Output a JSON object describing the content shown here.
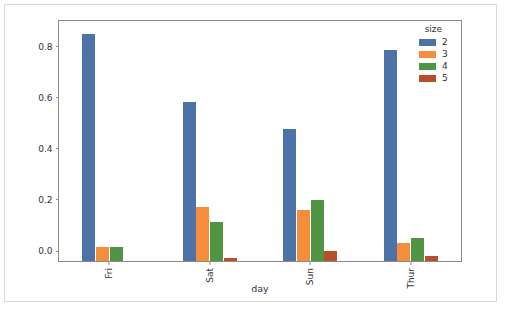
{
  "chart_data": {
    "type": "bar",
    "title": "",
    "xlabel": "day",
    "ylabel": "",
    "categories": [
      "Fri",
      "Sat",
      "Sun",
      "Thur"
    ],
    "series": [
      {
        "name": "2",
        "color": "#4c72a8",
        "values": [
          0.888,
          0.622,
          0.519,
          0.827
        ]
      },
      {
        "name": "3",
        "color": "#f58d3d",
        "values": [
          0.056,
          0.212,
          0.199,
          0.07
        ]
      },
      {
        "name": "4",
        "color": "#4f9m",
        "values": [
          0.056,
          0.152,
          0.24,
          0.09
        ]
      },
      {
        "name": "5",
        "color": "#b5502a",
        "values": [
          0.0,
          0.012,
          0.04,
          0.018
        ]
      }
    ],
    "ylim": [
      0.0,
      0.94
    ],
    "yticks": [
      0.0,
      0.2,
      0.4,
      0.6,
      0.8
    ],
    "ytick_labels": [
      "0.0",
      "0.2",
      "0.4",
      "0.6",
      "0.8"
    ],
    "grid": false,
    "legend": {
      "title": "size",
      "position": "upper right",
      "entries": [
        {
          "label": "2",
          "color": "#4c72a8"
        },
        {
          "label": "3",
          "color": "#f58d3d"
        },
        {
          "label": "4",
          "color": "#4f9544"
        },
        {
          "label": "5",
          "color": "#b5502a"
        }
      ]
    },
    "colors": {
      "size_2": "#4c72a8",
      "size_3": "#f58d3d",
      "size_4": "#4f9544",
      "size_5": "#b5502a",
      "axis": "#8a8a8a",
      "text": "#333333",
      "background": "#ffffff"
    }
  }
}
